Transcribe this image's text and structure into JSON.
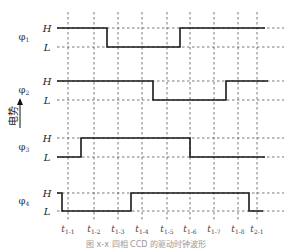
{
  "diagram": {
    "type": "timing-diagram",
    "y_axis_label": "电势",
    "level_labels": {
      "high": "H",
      "low": "L"
    },
    "signals": [
      {
        "name": "φ",
        "sub": "1",
        "label_y": 40,
        "h_y": 28,
        "l_y": 47,
        "path": "M57,28 H107 V47 H180 V28 H265"
      },
      {
        "name": "φ",
        "sub": "2",
        "label_y": 93,
        "h_y": 81,
        "l_y": 100,
        "path": "M57,81 H153 V100 H226 V81 H268"
      },
      {
        "name": "φ",
        "sub": "3",
        "label_y": 150,
        "h_y": 138,
        "l_y": 157,
        "path": "M57,157 H81 V138 H190 V157 H265"
      },
      {
        "name": "φ",
        "sub": "4",
        "label_y": 204,
        "h_y": 193,
        "l_y": 211,
        "path": "M57,193 H62 V211 H131 V193 H249 V211 H263"
      }
    ],
    "time_ticks": [
      {
        "t": "t",
        "sub": "1-1",
        "x": 68
      },
      {
        "t": "t",
        "sub": "1-2",
        "x": 94
      },
      {
        "t": "t",
        "sub": "1-3",
        "x": 118
      },
      {
        "t": "t",
        "sub": "1-4",
        "x": 142
      },
      {
        "t": "t",
        "sub": "1-5",
        "x": 167
      },
      {
        "t": "t",
        "sub": "1-6",
        "x": 190
      },
      {
        "t": "t",
        "sub": "1-7",
        "x": 214
      },
      {
        "t": "t",
        "sub": "1-8",
        "x": 238
      },
      {
        "t": "t",
        "sub": "2-1",
        "x": 257
      }
    ],
    "caption": "图 x-x  四相 CCD 的驱动时钟波形"
  }
}
